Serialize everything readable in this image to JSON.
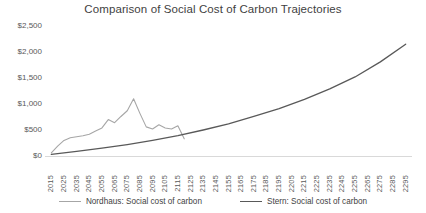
{
  "chart_data": {
    "type": "line",
    "title": "Comparison of Social Cost of Carbon Trajectories",
    "xlabel": "",
    "ylabel": "",
    "grid": false,
    "legend_position": "bottom",
    "ylim": [
      0,
      2500
    ],
    "ytick_values": [
      0,
      500,
      1000,
      1500,
      2000,
      2500
    ],
    "ytick_labels": [
      "$0",
      "$500",
      "$1,000",
      "$1,500",
      "$2,000",
      "$2,500"
    ],
    "x": [
      2015,
      2025,
      2035,
      2045,
      2055,
      2065,
      2075,
      2085,
      2095,
      2105,
      2115,
      2125,
      2135,
      2145,
      2155,
      2165,
      2175,
      2185,
      2195,
      2205,
      2215,
      2225,
      2235,
      2245,
      2255,
      2265,
      2275,
      2285,
      2295
    ],
    "xtick_labels": [
      "2015",
      "2025",
      "2035",
      "2045",
      "2055",
      "2065",
      "2075",
      "2085",
      "2095",
      "2105",
      "2115",
      "2125",
      "2135",
      "2145",
      "2155",
      "2165",
      "2175",
      "2185",
      "2195",
      "2205",
      "2215",
      "2225",
      "2235",
      "2245",
      "2255",
      "2265",
      "2275",
      "2285",
      "2295"
    ],
    "series": [
      {
        "name": "Nordhaus: Social cost of carbon",
        "color": "#a6a6a6",
        "width": 1.1,
        "x": [
          2015,
          2020,
          2025,
          2030,
          2035,
          2040,
          2045,
          2050,
          2055,
          2060,
          2065,
          2070,
          2075,
          2080,
          2085,
          2090,
          2095,
          2100,
          2105,
          2110,
          2115,
          2120
        ],
        "values": [
          60,
          190,
          300,
          350,
          370,
          390,
          420,
          480,
          540,
          700,
          640,
          760,
          870,
          1100,
          820,
          560,
          520,
          600,
          540,
          520,
          580,
          330
        ]
      },
      {
        "name": "Stern: Social cost of carbon",
        "color": "#595959",
        "width": 1.3,
        "x": [
          2015,
          2035,
          2055,
          2075,
          2095,
          2115,
          2135,
          2155,
          2175,
          2195,
          2215,
          2235,
          2255,
          2275,
          2295
        ],
        "values": [
          30,
          90,
          150,
          220,
          300,
          390,
          500,
          620,
          760,
          910,
          1090,
          1290,
          1520,
          1810,
          2150
        ]
      }
    ]
  },
  "legend": {
    "items": [
      {
        "label": "Nordhaus: Social cost of carbon",
        "color": "#a6a6a6",
        "width": "1px"
      },
      {
        "label": "Stern: Social cost of carbon",
        "color": "#595959",
        "width": "1.6px"
      }
    ]
  }
}
